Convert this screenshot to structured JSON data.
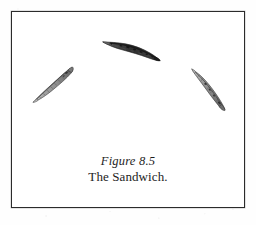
{
  "plate": {
    "border_color": "#2b2b2b",
    "background_color": "#ffffff",
    "page_background_color": "#fefefe"
  },
  "caption": {
    "figure_label": "Figure 8.5",
    "title": "The Sandwich."
  },
  "specimens": [
    {
      "id": "specimen-top-center",
      "name": "specimen-top-center",
      "tone": "dark",
      "fill_color": "#3a3a3a",
      "outline_color": "#262626",
      "rotation_deg": 14,
      "left": 88,
      "top": 28,
      "width": 62,
      "height": 22
    },
    {
      "id": "specimen-left",
      "name": "specimen-left",
      "tone": "light",
      "fill_color": "#9a9a9a",
      "outline_color": "#4a4a4a",
      "rotation_deg": -33,
      "left": 14,
      "top": 64,
      "width": 54,
      "height": 18
    },
    {
      "id": "specimen-right",
      "name": "specimen-right",
      "tone": "light",
      "fill_color": "#8f8f8f",
      "outline_color": "#454545",
      "rotation_deg": 43,
      "left": 170,
      "top": 68,
      "width": 54,
      "height": 18
    }
  ]
}
